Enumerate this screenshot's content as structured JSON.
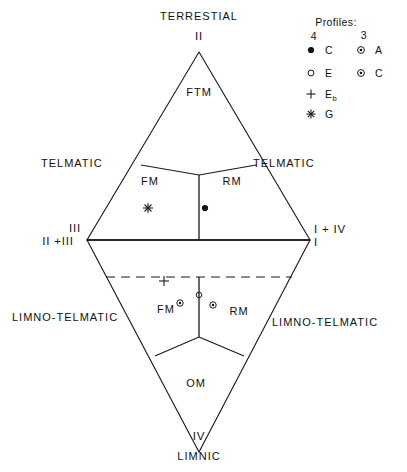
{
  "figure": {
    "type": "ternary-classification-diagram",
    "top_zone_label": "TERRESTIAL",
    "bottom_zone_label": "LIMNIC"
  },
  "zones": {
    "telmatic_left": "TELMATIC",
    "telmatic_right": "TELMATIC",
    "limno_telmatic_left": "LIMNO-TELMATIC",
    "limno_telmatic_right": "LIMNO-TELMATIC"
  },
  "vertices": {
    "top": "II",
    "left_upper": "III",
    "left_lower": "II +III",
    "right_upper": "I + IV",
    "right_lower": "I",
    "bottom": "IV"
  },
  "regions": {
    "ftm": "FTM",
    "fm_upper": "FM",
    "rm_upper": "RM",
    "fm_lower": "FM",
    "rm_lower": "RM",
    "om": "OM"
  },
  "legend": {
    "title": "Profiles:",
    "columns": [
      {
        "header": "4",
        "entries": [
          {
            "symbol": "filled-circle",
            "label": "C",
            "sub": ""
          },
          {
            "symbol": "open-circle",
            "label": "E",
            "sub": ""
          },
          {
            "symbol": "plus",
            "label": "E",
            "sub": "b"
          },
          {
            "symbol": "asterisk",
            "label": "G",
            "sub": ""
          }
        ]
      },
      {
        "header": "3",
        "entries": [
          {
            "symbol": "circled-dot",
            "label": "A",
            "sub": ""
          },
          {
            "symbol": "circled-dot",
            "label": "C",
            "sub": ""
          }
        ]
      }
    ]
  },
  "plotted_points": [
    {
      "symbol": "asterisk",
      "region": "FM",
      "half": "upper"
    },
    {
      "symbol": "filled-circle",
      "region": "RM",
      "half": "upper"
    },
    {
      "symbol": "plus",
      "region": "FM",
      "half": "lower"
    },
    {
      "symbol": "circled-dot",
      "region": "FM",
      "half": "lower"
    },
    {
      "symbol": "open-circle",
      "region": "FM",
      "half": "lower"
    },
    {
      "symbol": "circled-dot",
      "region": "FM",
      "half": "lower"
    }
  ],
  "colors": {
    "line": "#1a1a1a",
    "text": "#111111",
    "background": "#ffffff"
  }
}
